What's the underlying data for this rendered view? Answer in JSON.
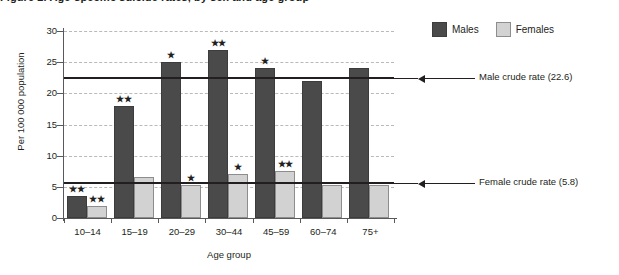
{
  "figure": {
    "title_fragment": "Figure 2.  Age-specific suicide rates, by sex and age group",
    "y_axis_title": "Per 100 000 population",
    "x_axis_title": "Age group"
  },
  "legend": {
    "position": "top-right",
    "entries": [
      {
        "label": "Males",
        "color": "#4a4a4a",
        "icon": "square-swatch"
      },
      {
        "label": "Females",
        "color": "#d2d2d2",
        "icon": "square-swatch"
      }
    ]
  },
  "annotations": [
    {
      "name": "male-crude-rate",
      "label": "Male crude rate (22.6)",
      "value": 22.6,
      "arrow": "left-arrow-icon"
    },
    {
      "name": "female-crude-rate",
      "label": "Female crude rate (5.8)",
      "value": 5.8,
      "arrow": "left-arrow-icon"
    }
  ],
  "chart_data": {
    "type": "bar",
    "title": "Age-specific suicide rates, by sex and age group",
    "xlabel": "Age group",
    "ylabel": "Per 100 000 population",
    "ylim": [
      0,
      30
    ],
    "yticks": [
      0,
      5,
      10,
      15,
      20,
      25,
      30
    ],
    "grid": true,
    "legend_position": "top-right",
    "categories": [
      "10–14",
      "15–19",
      "20–29",
      "30–44",
      "45–59",
      "60–74",
      "75+"
    ],
    "series": [
      {
        "name": "Males",
        "color": "#4a4a4a",
        "values": [
          3.5,
          18.0,
          25.0,
          27.0,
          24.0,
          22.0,
          24.0
        ],
        "markers": [
          "**",
          "**",
          "*",
          "**",
          "*",
          "",
          ""
        ]
      },
      {
        "name": "Females",
        "color": "#d2d2d2",
        "values": [
          2.0,
          6.5,
          5.3,
          7.0,
          7.5,
          5.3,
          5.3
        ],
        "markers": [
          "**",
          "",
          "*",
          "*",
          "**",
          "",
          ""
        ]
      }
    ],
    "reference_lines": [
      {
        "label": "Male crude rate (22.6)",
        "value": 22.6
      },
      {
        "label": "Female crude rate (5.8)",
        "value": 5.8
      }
    ]
  }
}
